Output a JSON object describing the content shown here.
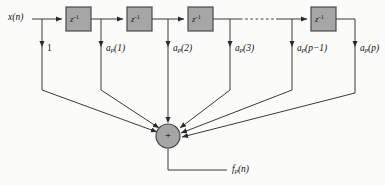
{
  "figure": {
    "type": "signal-flow-diagram",
    "background_color": "#fbfbfa",
    "line_color": "#3a3a3a",
    "box_fill": "#a6a6a6",
    "box_stroke": "#4a4a4a",
    "summer_fill": "#a6a6a6",
    "summer_stroke": "#4a4a4a"
  },
  "input": {
    "label_var": "x",
    "label_arg": "(n)",
    "label_text": "x(n)",
    "x": 8,
    "y": 13
  },
  "output": {
    "label_var": "f",
    "label_sub": "p",
    "label_arg": "(n)",
    "label_text": "f_p(n)",
    "x": 232,
    "y": 165
  },
  "delay_blocks": [
    {
      "id": "delay-1",
      "label_base": "z",
      "label_exp": "-1",
      "label_text": "z^-1",
      "x": 66,
      "y": 7,
      "w": 25,
      "h": 24
    },
    {
      "id": "delay-2",
      "label_base": "z",
      "label_exp": "-1",
      "label_text": "z^-1",
      "x": 127,
      "y": 7,
      "w": 25,
      "h": 24
    },
    {
      "id": "delay-3",
      "label_base": "z",
      "label_exp": "-1",
      "label_text": "z^-1",
      "x": 188,
      "y": 7,
      "w": 25,
      "h": 24
    },
    {
      "id": "delay-p",
      "label_base": "z",
      "label_exp": "-1",
      "label_text": "z^-1",
      "x": 311,
      "y": 7,
      "w": 25,
      "h": 24
    }
  ],
  "taps": [
    {
      "id": "tap-0",
      "label_var": "",
      "label_sub": "",
      "label_arg": "1",
      "label_text": "1",
      "tap_x": 42,
      "label_x": 47,
      "label_y": 48,
      "turn_y": 90
    },
    {
      "id": "tap-1",
      "label_var": "a",
      "label_sub": "p",
      "label_arg": "(1)",
      "label_text": "a_p(1)",
      "tap_x": 101,
      "label_x": 106,
      "label_y": 48,
      "turn_y": 90
    },
    {
      "id": "tap-2",
      "label_var": "a",
      "label_sub": "p",
      "label_arg": "(2)",
      "label_text": "a_p(2)",
      "tap_x": 168,
      "label_x": 173,
      "label_y": 48,
      "turn_y": 124
    },
    {
      "id": "tap-3",
      "label_var": "a",
      "label_sub": "p",
      "label_arg": "(3)",
      "label_text": "a_p(3)",
      "tap_x": 230,
      "label_x": 235,
      "label_y": 48,
      "turn_y": 90
    },
    {
      "id": "tap-pm1",
      "label_var": "a",
      "label_sub": "p",
      "label_arg": "(p−1)",
      "label_text": "a_p(p-1)",
      "tap_x": 292,
      "label_x": 297,
      "label_y": 48,
      "turn_y": 90
    },
    {
      "id": "tap-p",
      "label_var": "a",
      "label_sub": "p",
      "label_arg": "(p)",
      "label_text": "a_p(p)",
      "tap_x": 355,
      "label_x": 360,
      "label_y": 48,
      "turn_y": 93
    }
  ],
  "summer": {
    "symbol": "+",
    "cx": 168,
    "cy": 136,
    "r": 12
  },
  "dashed_section": {
    "from_x": 240,
    "to_x": 276,
    "y": 19
  }
}
